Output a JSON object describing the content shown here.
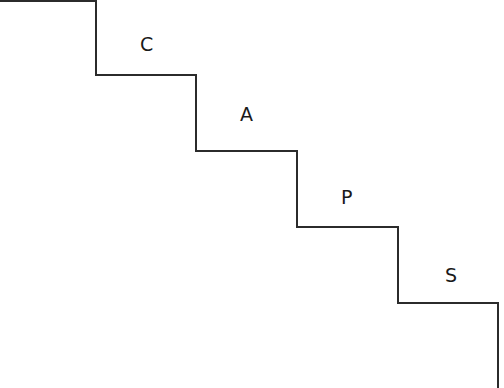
{
  "diagram": {
    "type": "staircase",
    "line_color": "#2b2b2b",
    "steps": [
      {
        "label": "C",
        "x": 140,
        "y": 35
      },
      {
        "label": "A",
        "x": 240,
        "y": 111
      },
      {
        "label": "P",
        "x": 340,
        "y": 187
      },
      {
        "label": "S",
        "x": 442,
        "y": 263
      }
    ]
  }
}
